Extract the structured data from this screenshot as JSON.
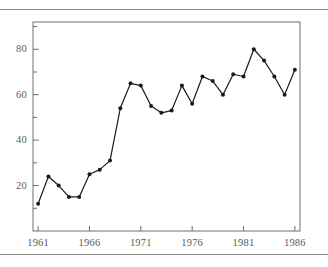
{
  "page": {
    "background_color": "#ffffff",
    "rule_color": "#8a8a8a",
    "has_top_rule": true,
    "has_bottom_rule": true
  },
  "chart_data": {
    "type": "line",
    "title": "",
    "subtitle": "",
    "xlabel": "",
    "ylabel": "",
    "x": [
      1961,
      1962,
      1963,
      1964,
      1965,
      1966,
      1967,
      1968,
      1969,
      1970,
      1971,
      1972,
      1973,
      1974,
      1975,
      1976,
      1977,
      1978,
      1979,
      1980,
      1981,
      1982,
      1983,
      1984,
      1985,
      1986
    ],
    "values": [
      12,
      24,
      20,
      15,
      15,
      25,
      27,
      31,
      54,
      65,
      64,
      55,
      52,
      53,
      64,
      56,
      68,
      66,
      60,
      69,
      68,
      80,
      75,
      68,
      60,
      71
    ],
    "series": [
      {
        "name": "series-1",
        "values": [
          12,
          24,
          20,
          15,
          15,
          25,
          27,
          31,
          54,
          65,
          64,
          55,
          52,
          53,
          64,
          56,
          68,
          66,
          60,
          69,
          68,
          80,
          75,
          68,
          60,
          71
        ],
        "color": "#1a1a1a",
        "marker": "filled-circle",
        "line_width": 1.2
      }
    ],
    "xlim": [
      1960.5,
      1986.5
    ],
    "ylim": [
      0,
      92
    ],
    "xticks": [
      1961,
      1966,
      1971,
      1976,
      1981,
      1986
    ],
    "xtick_labels": [
      "1961",
      "1966",
      "1971",
      "1976",
      "1981",
      "1986"
    ],
    "yticks": [
      20,
      40,
      60,
      80
    ],
    "ytick_labels": [
      "20",
      "40",
      "60",
      "80"
    ],
    "yticks_minor": [
      10,
      30,
      50,
      70,
      90
    ],
    "grid": false,
    "legend": null,
    "legend_position": "none",
    "frame": "box",
    "frame_color": "#6e6e6e",
    "tick_color": "#6e6e6e",
    "label_color": "#5a5a5a",
    "annotations": []
  }
}
